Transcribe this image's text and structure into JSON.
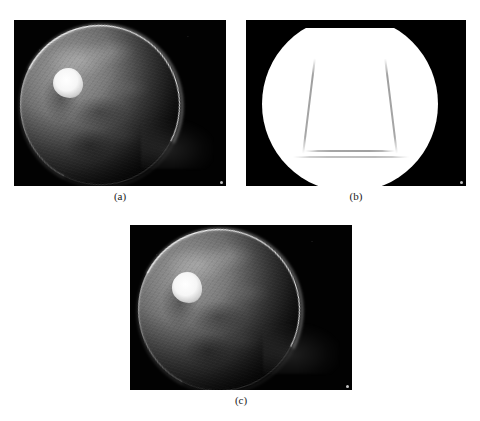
{
  "figure": {
    "background_color": "#ffffff",
    "panel_count": 3,
    "layout": "two panels on top row, one centered below"
  },
  "panels": [
    {
      "id": "a",
      "caption": "(a)",
      "kind": "grayscale-satellite-image",
      "subject": "globe",
      "background_color": "#000000",
      "overlay_bottom_left": "",
      "overlay_bottom_right": "",
      "box": {
        "x": 14,
        "y": 20,
        "w": 212,
        "h": 166
      }
    },
    {
      "id": "b",
      "caption": "(b)",
      "kind": "binary-segmentation-mask",
      "subject": "globe mask",
      "background_color": "#000000",
      "foreground_color": "#ffffff",
      "overlay_bottom_left": "",
      "overlay_bottom_right": "",
      "box": {
        "x": 246,
        "y": 20,
        "w": 220,
        "h": 166
      }
    },
    {
      "id": "c",
      "caption": "(c)",
      "kind": "grayscale-satellite-image",
      "subject": "globe",
      "background_color": "#000000",
      "overlay_bottom_left": "",
      "overlay_bottom_right": "",
      "box": {
        "x": 130,
        "y": 225,
        "w": 222,
        "h": 165
      }
    }
  ],
  "captions": {
    "a": "(a)",
    "b": "(b)",
    "c": "(c)"
  },
  "colors": {
    "page_background": "#ffffff",
    "image_background": "#000000",
    "mask_foreground": "#ffffff",
    "caption_text": "#1a1a1a",
    "globe_highlight": "#ffffff"
  }
}
